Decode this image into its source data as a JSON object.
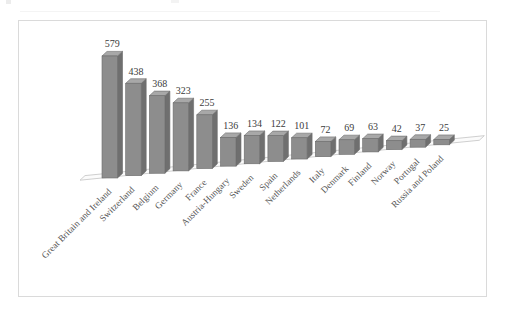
{
  "chart_data": {
    "type": "bar",
    "title": "",
    "subtitle": "",
    "xlabel": "",
    "ylabel": "",
    "grid": false,
    "legend": false,
    "legend_position": "none",
    "style": "3d-column",
    "ylim": [
      0,
      620
    ],
    "categories": [
      "Great Britain and Ireland",
      "Switzerland",
      "Belgium",
      "Germany",
      "France",
      "Austria-Hungary",
      "Sweden",
      "Spain",
      "Netherlands",
      "Italy",
      "Denmark",
      "Finland",
      "Norway",
      "Portugal",
      "Russia and Poland"
    ],
    "values": [
      579,
      438,
      368,
      323,
      255,
      136,
      134,
      122,
      101,
      72,
      69,
      63,
      42,
      37,
      25
    ],
    "value_labels": [
      "579",
      "438",
      "368",
      "323",
      "255",
      "136",
      "134",
      "122",
      "101",
      "72",
      "69",
      "63",
      "42",
      "37",
      "25"
    ],
    "colors": {
      "bar_front": "#8d8d8d",
      "bar_side": "#6f6f6f",
      "bar_top": "#a8a8a8",
      "bar_outline": "#6b6b6b",
      "floor": "#fbfbfb",
      "floor_edge": "#c9c9c9",
      "frame_border": "#dadada",
      "background": "#ffffff",
      "value_text": "#3b3b3b",
      "category_text": "#555555"
    }
  }
}
